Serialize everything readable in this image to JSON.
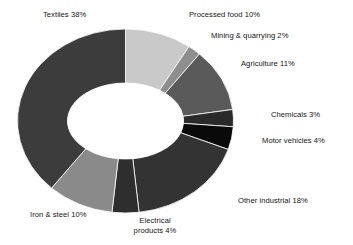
{
  "figure": {
    "background_color": "#ffffff",
    "cropped_title_fragment": ""
  },
  "chart_data": {
    "type": "pie",
    "variant": "donut",
    "title": "",
    "subtitle": "",
    "xlabel": "",
    "ylabel": "",
    "units": "percent",
    "total": 100,
    "legend_position": "none",
    "labels_position": "outside-callout",
    "grid": false,
    "start_angle_deg": 0,
    "direction": "clockwise",
    "categories": [
      "Processed food",
      "Mining & quarrying",
      "Agriculture",
      "Chemicals",
      "Motor vehicles",
      "Other industrial",
      "Electrical products",
      "Iron & steel",
      "Textiles"
    ],
    "values": [
      10,
      2,
      11,
      3,
      4,
      18,
      4,
      10,
      38
    ],
    "slice_colors": [
      "#c9c9c9",
      "#8e8e8e",
      "#5a5a5a",
      "#2a2a2a",
      "#0a0a0a",
      "#333333",
      "#2e2e2e",
      "#8a8a8a",
      "#3c3c3c"
    ],
    "slices": [
      {
        "label": "Processed food 10%",
        "name": "Processed food",
        "value": 10,
        "color": "#c9c9c9"
      },
      {
        "label": "Mining & quarrying 2%",
        "name": "Mining & quarrying",
        "value": 2,
        "color": "#8e8e8e"
      },
      {
        "label": "Agriculture 11%",
        "name": "Agriculture",
        "value": 11,
        "color": "#5a5a5a"
      },
      {
        "label": "Chemicals 3%",
        "name": "Chemicals",
        "value": 3,
        "color": "#2a2a2a"
      },
      {
        "label": "Motor vehicles 4%",
        "name": "Motor vehicles",
        "value": 4,
        "color": "#0a0a0a"
      },
      {
        "label": "Other industrial 18%",
        "name": "Other industrial",
        "value": 18,
        "color": "#333333"
      },
      {
        "label": "Electrical products 4%",
        "name": "Electrical products",
        "value": 4,
        "color": "#2e2e2e"
      },
      {
        "label": "Iron & steel 10%",
        "name": "Iron & steel",
        "value": 10,
        "color": "#8a8a8a"
      },
      {
        "label": "Textiles 38%",
        "name": "Textiles",
        "value": 38,
        "color": "#3c3c3c"
      }
    ]
  },
  "labels": {
    "textiles": "Textiles 38%",
    "processed_food": "Processed food 10%",
    "mining_quarrying": "Mining & quarrying 2%",
    "agriculture": "Agriculture 11%",
    "chemicals": "Chemicals 3%",
    "motor_vehicles": "Motor vehicles 4%",
    "other_industrial": "Other industrial 18%",
    "electrical_products_line1": "Electrical",
    "electrical_products_line2": "products 4%",
    "iron_steel": "Iron & steel 10%"
  }
}
